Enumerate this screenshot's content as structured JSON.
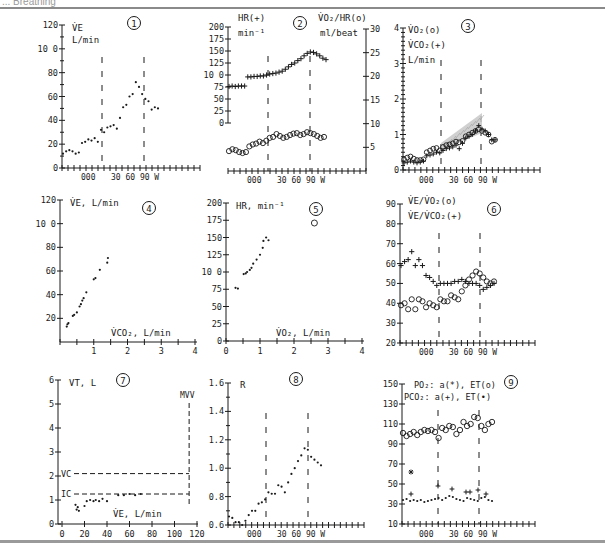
{
  "header": {
    "title": "... Breathing"
  },
  "chart_data": [
    {
      "panel": 1,
      "type": "scatter",
      "title": "VE L/min",
      "ylabel": "V̇E",
      "yunit": "L/min",
      "yticks": [
        0,
        20,
        40,
        60,
        80,
        100,
        120
      ],
      "ylim": [
        0,
        120
      ],
      "xticks_labels": [
        "0",
        "0",
        "0",
        "30",
        "60",
        "90",
        "W"
      ],
      "xlabel": "W",
      "phase_markers": [
        "start unloaded",
        "start load"
      ],
      "x": [
        1,
        2,
        3,
        4,
        5,
        6,
        7,
        8,
        9,
        10,
        11,
        12,
        13,
        14,
        15,
        16,
        17,
        18,
        19,
        20,
        21,
        22,
        23,
        24,
        25,
        26,
        27,
        28,
        29,
        30,
        31
      ],
      "values": [
        12,
        14,
        15,
        14,
        12,
        13,
        21,
        22,
        24,
        23,
        25,
        22,
        32,
        30,
        34,
        35,
        36,
        33,
        42,
        51,
        53,
        60,
        62,
        72,
        68,
        62,
        58,
        56,
        49,
        51,
        50
      ]
    },
    {
      "panel": 2,
      "type": "scatter",
      "series": [
        {
          "name": "HR(+)",
          "unit": "min-1",
          "axis": "left",
          "marker": "+",
          "values": [
            76,
            77,
            76,
            77,
            77,
            77,
            96,
            96,
            97,
            97,
            98,
            98,
            100,
            102,
            103,
            104,
            106,
            108,
            112,
            117,
            122,
            125,
            130,
            134,
            140,
            145,
            148,
            147,
            144,
            140,
            135,
            132
          ]
        },
        {
          "name": "VO2/HR(o)",
          "unit": "ml/beat",
          "axis": "right",
          "marker": "o",
          "values": [
            4.2,
            4.6,
            4.4,
            4.0,
            3.8,
            4.0,
            5.2,
            5.6,
            5.8,
            6.2,
            5.9,
            6.4,
            7.0,
            7.2,
            7.8,
            7.4,
            7.0,
            7.2,
            7.6,
            7.9,
            8.0,
            7.6,
            7.8,
            8.2,
            8.0,
            7.8,
            7.4,
            7.0,
            7.2
          ]
        }
      ],
      "yticks_left": [
        0,
        25,
        50,
        75,
        100,
        125,
        150,
        175,
        200
      ],
      "ylim_left": [
        0,
        200
      ],
      "yticks_right": [
        5,
        10,
        15,
        20,
        25,
        30
      ],
      "ylim_right": [
        0,
        30
      ],
      "xticks_labels": [
        "0",
        "0",
        "0",
        "30",
        "60",
        "90",
        "W"
      ]
    },
    {
      "panel": 3,
      "type": "scatter",
      "series": [
        {
          "name": "VO2(o)",
          "unit": "L/min",
          "marker": "o",
          "values": [
            0.3,
            0.35,
            0.38,
            0.32,
            0.28,
            0.28,
            0.3,
            0.5,
            0.55,
            0.6,
            0.62,
            0.55,
            0.65,
            0.7,
            0.72,
            0.75,
            0.8,
            0.78,
            0.82,
            0.95,
            1.0,
            1.05,
            1.1,
            1.15,
            1.1,
            1.05,
            1.0,
            0.8,
            0.85
          ]
        },
        {
          "name": "VCO2(+)",
          "unit": "L/min",
          "marker": "+",
          "values": [
            0.2,
            0.22,
            0.25,
            0.22,
            0.2,
            0.22,
            0.25,
            0.4,
            0.42,
            0.45,
            0.5,
            0.48,
            0.55,
            0.6,
            0.62,
            0.65,
            0.7,
            0.6,
            0.75,
            0.9,
            0.95,
            1.0,
            1.1,
            1.25,
            1.15,
            1.1,
            1.0,
            0.85,
            0.85
          ]
        }
      ],
      "yticks": [
        0,
        1,
        2,
        3,
        4
      ],
      "ylim": [
        0,
        4
      ],
      "shaded_region": "VCO2 excess above VO2 during load",
      "xticks_labels": [
        "0",
        "0",
        "0",
        "30",
        "60",
        "90",
        "W"
      ]
    },
    {
      "panel": 4,
      "type": "scatter",
      "title": "VE, L/min vs VCO2, L/min",
      "ylabel": "V̇E, L/min",
      "xlabel": "V̇CO2, L/min",
      "yticks": [
        20,
        40,
        60,
        80,
        100,
        120
      ],
      "ylim": [
        0,
        120
      ],
      "xticks": [
        1,
        2,
        3,
        4
      ],
      "xlim": [
        0,
        4
      ],
      "x": [
        0.2,
        0.22,
        0.25,
        0.38,
        0.42,
        0.5,
        0.58,
        0.62,
        0.66,
        0.7,
        0.78,
        1.0,
        1.05,
        1.18,
        1.4,
        1.42
      ],
      "values": [
        13,
        15,
        16,
        22,
        23,
        25,
        30,
        32,
        35,
        37,
        42,
        53,
        54,
        61,
        67,
        71
      ]
    },
    {
      "panel": 5,
      "type": "scatter",
      "title": "HR, min-1 vs VO2, L/min",
      "ylabel": "HR, min-1",
      "xlabel": "V̇O2, L/min",
      "yticks": [
        0,
        25,
        50,
        75,
        100,
        125,
        150,
        175,
        200
      ],
      "ylim": [
        0,
        200
      ],
      "xticks": [
        0,
        1,
        2,
        3,
        4
      ],
      "xlim": [
        0,
        4
      ],
      "x": [
        0.28,
        0.35,
        0.52,
        0.58,
        0.62,
        0.7,
        0.75,
        0.8,
        0.9,
        1.0,
        1.08,
        1.1,
        1.18,
        1.25
      ],
      "values": [
        77,
        76,
        97,
        98,
        100,
        103,
        106,
        112,
        118,
        125,
        135,
        145,
        150,
        146
      ],
      "predicted_max": {
        "x": 2.6,
        "y": 171,
        "marker": "o"
      }
    },
    {
      "panel": 6,
      "type": "scatter",
      "series": [
        {
          "name": "VE/VO2(o)",
          "marker": "o",
          "values": [
            39,
            40,
            37,
            42,
            37,
            42,
            41,
            38,
            40,
            39,
            38,
            42,
            41,
            41,
            44,
            43,
            42,
            46,
            49,
            52,
            54,
            56,
            55,
            53,
            51,
            50,
            51
          ]
        },
        {
          "name": "VE/VCO2(+)",
          "marker": "+",
          "values": [
            59,
            61,
            62,
            66,
            59,
            62,
            59,
            54,
            53,
            51,
            49,
            50,
            50,
            50,
            50,
            51,
            51,
            52,
            51,
            50,
            50,
            50,
            49,
            47,
            48,
            49,
            50
          ]
        }
      ],
      "yticks": [
        20,
        30,
        40,
        50,
        60,
        70,
        80,
        90
      ],
      "ylim": [
        20,
        90
      ],
      "xticks_labels": [
        "0",
        "0",
        "0",
        "30",
        "60",
        "90",
        "W"
      ]
    },
    {
      "panel": 7,
      "type": "scatter",
      "title": "VT, L vs VE, L/min",
      "ylabel": "VT, L",
      "xlabel": "V̇E, L/min",
      "yticks": [
        0,
        1,
        2,
        3,
        4,
        5,
        6
      ],
      "ylim": [
        0,
        6
      ],
      "xticks": [
        0,
        20,
        40,
        60,
        80,
        100,
        120
      ],
      "xlim": [
        0,
        120
      ],
      "x": [
        12,
        13,
        14,
        15,
        20,
        22,
        25,
        28,
        30,
        33,
        36,
        40,
        50,
        55,
        60,
        65,
        70
      ],
      "values": [
        0.8,
        0.6,
        0.7,
        0.55,
        0.75,
        0.95,
        1.0,
        0.95,
        1.0,
        0.95,
        1.05,
        0.95,
        1.2,
        1.2,
        1.25,
        1.2,
        1.25
      ],
      "reference_lines": {
        "VC": 2.1,
        "IC": 1.25,
        "MVV": 113
      },
      "reference_labels": [
        "VC",
        "IC",
        "MVV"
      ]
    },
    {
      "panel": 8,
      "type": "scatter",
      "title": "R",
      "ylabel": "R",
      "yticks": [
        0.6,
        0.8,
        1.0,
        1.2,
        1.4,
        1.6
      ],
      "ylim": [
        0.6,
        1.6
      ],
      "xticks_labels": [
        "0",
        "0",
        "0",
        "30",
        "60",
        "90",
        "W"
      ],
      "values": [
        0.66,
        0.65,
        0.62,
        0.62,
        0.6,
        0.63,
        0.67,
        0.7,
        0.7,
        0.75,
        0.76,
        0.78,
        0.83,
        0.82,
        0.82,
        0.88,
        0.87,
        0.83,
        0.9,
        0.96,
        1.0,
        1.05,
        1.09,
        1.14,
        1.13,
        1.08,
        1.06,
        1.04,
        1.02
      ]
    },
    {
      "panel": 9,
      "type": "scatter",
      "series": [
        {
          "name": "PO2: a(*)",
          "marker": "*",
          "values": [
            62
          ]
        },
        {
          "name": "PO2: ET(o)",
          "marker": "o",
          "values": [
            101,
            98,
            100,
            102,
            99,
            102,
            104,
            103,
            104,
            102,
            96,
            106,
            104,
            108,
            107,
            100,
            104,
            112,
            108,
            110,
            117,
            116,
            108,
            104,
            110,
            112
          ]
        },
        {
          "name": "PCO2: a(+)",
          "marker": "+",
          "values": [
            40,
            48,
            45,
            42,
            42,
            44,
            40
          ]
        },
        {
          "name": "PCO2: ET(•)",
          "marker": "•",
          "values": [
            34,
            35,
            33,
            34,
            33,
            34,
            32,
            33,
            34,
            35,
            36,
            34,
            36,
            38,
            37,
            35,
            34,
            33,
            36,
            35,
            34,
            33,
            36,
            37,
            34,
            33
          ]
        }
      ],
      "yticks": [
        10,
        30,
        50,
        70,
        90,
        110,
        130,
        150
      ],
      "ylim": [
        10,
        150
      ],
      "xticks_labels": [
        "0",
        "0",
        "0",
        "30",
        "60",
        "90",
        "W"
      ]
    }
  ],
  "labels": {
    "p1": {
      "num": "1",
      "y1": "V̇E",
      "y2": "L/min"
    },
    "p2": {
      "num": "2",
      "l1": "HR(+)",
      "l2": "min⁻¹",
      "r1": "V̇O₂/HR(o)",
      "r2": "ml/beat"
    },
    "p3": {
      "num": "3",
      "l1": "V̇O₂(o)",
      "l2": "V̇CO₂(+)",
      "l3": "L/min"
    },
    "p4": {
      "num": "4",
      "y": "V̇E, L/min",
      "x": "V̇CO₂, L/min"
    },
    "p5": {
      "num": "5",
      "y": "HR, min⁻¹",
      "x": "V̇O₂, L/min"
    },
    "p6": {
      "num": "6",
      "l1": "V̇E/V̇O₂(o)",
      "l2": "V̇E/V̇CO₂(+)"
    },
    "p7": {
      "num": "7",
      "y": "VT, L",
      "x": "V̇E, L/min",
      "vc": "VC",
      "ic": "IC",
      "mvv": "MVV"
    },
    "p8": {
      "num": "8",
      "y": "R"
    },
    "p9": {
      "num": "9",
      "l1": "PO₂: a(*), ET(o)",
      "l2": "PCO₂: a(+), ET(•)"
    },
    "workload": {
      "a": "0",
      "b": "0",
      "c": "0",
      "d": "30",
      "e": "60",
      "f": "90",
      "w": "W"
    }
  }
}
